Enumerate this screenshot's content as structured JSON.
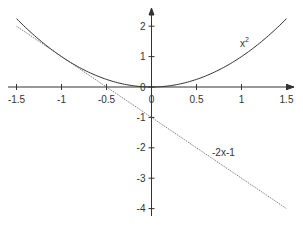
{
  "chart_data": {
    "type": "line",
    "title": "",
    "xlabel": "",
    "ylabel": "",
    "xlim": [
      -1.5,
      1.5
    ],
    "ylim": [
      -4,
      2.3
    ],
    "grid": false,
    "x_ticks": [
      -1.5,
      -1,
      -0.5,
      0,
      0.5,
      1,
      1.5
    ],
    "x_tick_labels": [
      "-1.5",
      "-1",
      "-0.5",
      "0",
      "0.5",
      "1",
      "1.5"
    ],
    "y_ticks": [
      -4,
      -3,
      -2,
      -1,
      0,
      1,
      2
    ],
    "y_tick_labels": [
      "-4",
      "-3",
      "-2",
      "-1",
      "0",
      "1",
      "2"
    ],
    "series": [
      {
        "name": "x^2",
        "label": "x",
        "label_superscript": "2",
        "style": "solid",
        "x": [
          -1.5,
          -1.25,
          -1,
          -0.75,
          -0.5,
          -0.25,
          0,
          0.25,
          0.5,
          0.75,
          1,
          1.25,
          1.5
        ],
        "values": [
          2.25,
          1.5625,
          1,
          0.5625,
          0.25,
          0.0625,
          0,
          0.0625,
          0.25,
          0.5625,
          1,
          1.5625,
          2.25
        ]
      },
      {
        "name": "-2x-1",
        "label": "-2x-1",
        "style": "dotted",
        "x": [
          -1.5,
          1.5
        ],
        "values": [
          2,
          -4
        ]
      }
    ],
    "annotations": [
      {
        "text": "x²",
        "x": 1.05,
        "y": 1.3
      },
      {
        "text": "-2x-1",
        "x": 0.75,
        "y": -2.2
      }
    ]
  }
}
